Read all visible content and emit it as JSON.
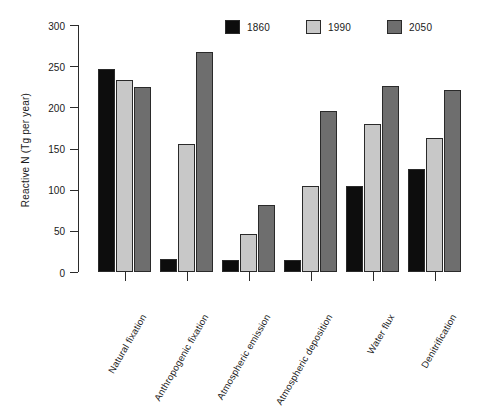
{
  "chart_data": {
    "type": "bar",
    "title": "",
    "xlabel": "",
    "ylabel": "Reactive N (Tg per year)",
    "ylim": [
      0,
      300
    ],
    "yticks": [
      0,
      50,
      100,
      150,
      200,
      250,
      300
    ],
    "grid": false,
    "legend_position": "top",
    "categories": [
      "Natural fixation",
      "Anthropogenic fixation",
      "Atmospheric emission",
      "Atmospheric deposition",
      "Water flux",
      "Denitrification"
    ],
    "series": [
      {
        "name": "1860",
        "color": "#0d0d0d",
        "values": [
          247,
          16,
          14,
          14,
          105,
          125
        ]
      },
      {
        "name": "1990",
        "color": "#c8c8c8",
        "values": [
          233,
          156,
          46,
          104,
          180,
          163
        ]
      },
      {
        "name": "2050",
        "color": "#6e6e6e",
        "values": [
          225,
          267,
          82,
          195,
          226,
          221
        ]
      }
    ]
  },
  "legend": {
    "entries": [
      {
        "label": "1860",
        "color": "#0d0d0d"
      },
      {
        "label": "1990",
        "color": "#c8c8c8"
      },
      {
        "label": "2050",
        "color": "#6e6e6e"
      }
    ]
  },
  "axes": {
    "y_title": "Reactive N (Tg per year)",
    "y_tick_labels": [
      "0",
      "50",
      "100",
      "150",
      "200",
      "250",
      "300"
    ]
  }
}
